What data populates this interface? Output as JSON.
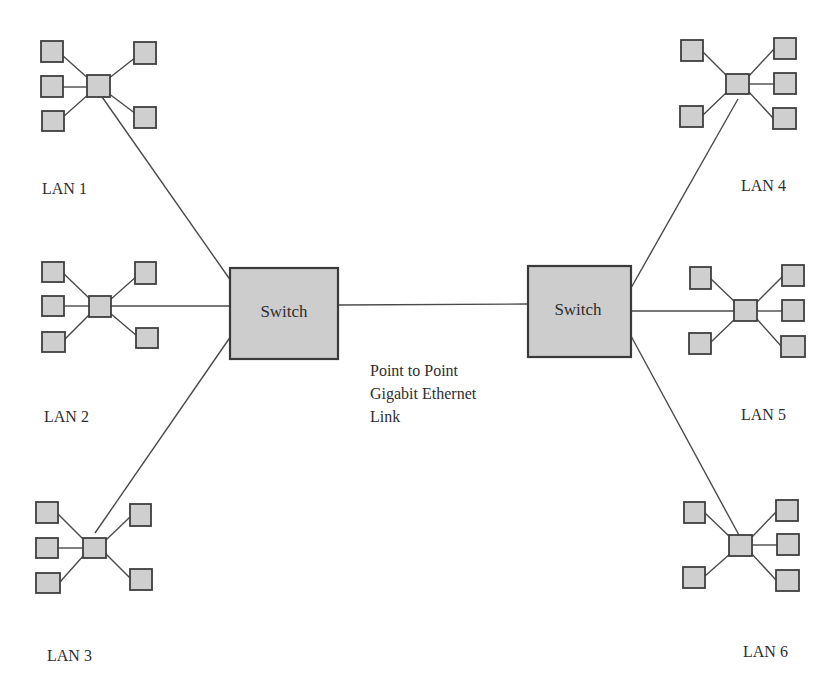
{
  "diagram": {
    "title": "",
    "switches": [
      {
        "id": "switch-left",
        "label": "Switch"
      },
      {
        "id": "switch-right",
        "label": "Switch"
      }
    ],
    "backbone_link": {
      "from": "switch-left",
      "to": "switch-right",
      "caption_lines": [
        "Point to Point",
        "Gigabit Ethernet",
        "Link"
      ]
    },
    "lans": [
      {
        "id": "lan-1",
        "label": "LAN 1",
        "switch": "switch-left",
        "node_count": 5
      },
      {
        "id": "lan-2",
        "label": "LAN 2",
        "switch": "switch-left",
        "node_count": 5
      },
      {
        "id": "lan-3",
        "label": "LAN 3",
        "switch": "switch-left",
        "node_count": 5
      },
      {
        "id": "lan-4",
        "label": "LAN 4",
        "switch": "switch-right",
        "node_count": 5
      },
      {
        "id": "lan-5",
        "label": "LAN 5",
        "switch": "switch-right",
        "node_count": 5
      },
      {
        "id": "lan-6",
        "label": "LAN 6",
        "switch": "switch-right",
        "node_count": 5
      }
    ],
    "colors": {
      "box_fill": "#cfcfcf",
      "stroke": "#3f3f3f",
      "text": "#2e2e2e",
      "background": "#ffffff"
    }
  }
}
